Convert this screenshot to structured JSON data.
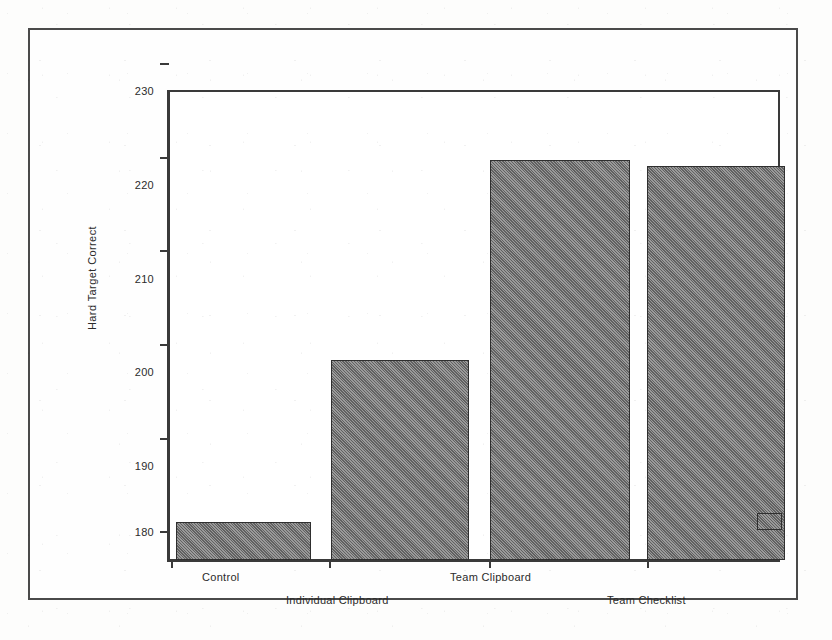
{
  "chart_data": {
    "type": "bar",
    "title": "",
    "subtitle": "",
    "xlabel": "",
    "ylabel": "Hard Target Correct",
    "categories": [
      "Control",
      "Individual Clipboard",
      "Team Clipboard",
      "Team Checklist"
    ],
    "values": [
      184.1,
      201.3,
      222.6,
      221.9
    ],
    "ylim": [
      180,
      230
    ],
    "yticks": [
      "180",
      "190",
      "200",
      "210",
      "220",
      "230"
    ],
    "ytick_values": [
      180,
      190,
      200,
      210,
      220,
      230
    ],
    "grid": false,
    "legend": "none",
    "bar_color": "#6e6e6e",
    "bar_edge_color": "#2f2f2f",
    "axis_color": "#3a3a3a",
    "background_color": "#ffffff"
  },
  "figure": {
    "frame_label": "figure-border",
    "axis_label_rotated": "Hard Target Correct",
    "detached_swatch_label": ""
  }
}
